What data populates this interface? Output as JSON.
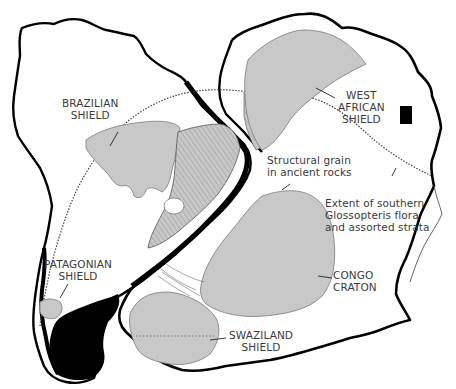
{
  "figure": {
    "type": "geologic reconstruction map",
    "colors": {
      "shield_fill": "#c8c8c8",
      "shield_stroke": "#7a7a7a",
      "coastline": "#000000",
      "label_text": "#3a3a3a",
      "background": "#ffffff"
    }
  },
  "labels": {
    "brazilian_shield": [
      "BRAZILIAN",
      "SHIELD"
    ],
    "west_african_shield": [
      "WEST",
      "AFRICAN",
      "SHIELD"
    ],
    "structural_grain": [
      "Structural grain",
      "in ancient rocks"
    ],
    "glossopteris": [
      "Extent of southern",
      "Glossopteris flora",
      "and assorted strata"
    ],
    "congo_craton": [
      "CONGO",
      "CRATON"
    ],
    "patagonian_shield": [
      "PATAGONIAN",
      "SHIELD"
    ],
    "swaziland_shield": [
      "SWAZILAND",
      "SHIELD"
    ]
  },
  "shields": [
    {
      "name": "Brazilian Shield",
      "continent": "South America"
    },
    {
      "name": "Patagonian Shield",
      "continent": "South America"
    },
    {
      "name": "West African Shield",
      "continent": "Africa"
    },
    {
      "name": "Congo Craton",
      "continent": "Africa"
    },
    {
      "name": "Swaziland Shield",
      "continent": "Africa"
    }
  ]
}
